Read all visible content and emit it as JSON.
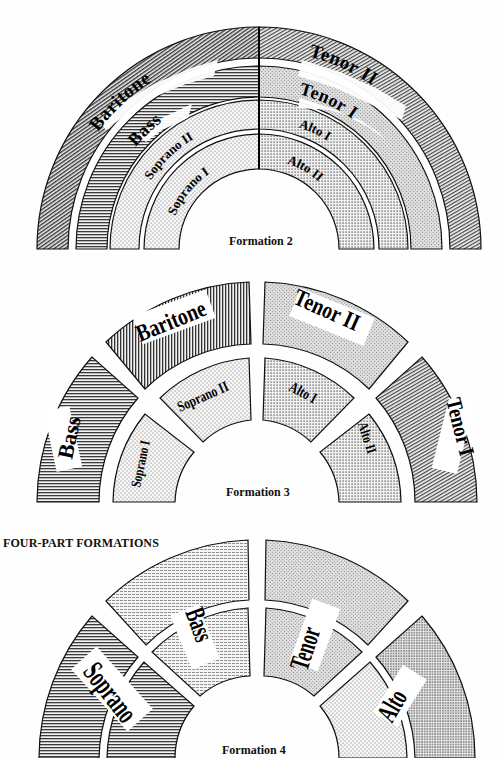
{
  "formation2": {
    "caption": "Formation 2",
    "left": [
      "Baritone",
      "Bass",
      "Soprano II",
      "Soprano I"
    ],
    "right": [
      "Tenor II",
      "Tenor I",
      "Alto I",
      "Alto II"
    ]
  },
  "formation3": {
    "caption": "Formation 3",
    "outer": [
      "Bass",
      "Baritone",
      "Tenor II",
      "Tenor I"
    ],
    "inner": [
      "Soprano I",
      "Soprano II",
      "Alto I",
      "Alto II"
    ]
  },
  "section_heading": "FOUR-PART FORMATIONS",
  "formation4": {
    "caption": "Formation 4",
    "sections": [
      "Soprano",
      "Bass",
      "Tenor",
      "Alto"
    ]
  },
  "colors": {
    "ink": "#111111",
    "paper": "#fefefe"
  }
}
